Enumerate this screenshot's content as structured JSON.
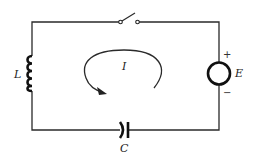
{
  "diagram": {
    "type": "circuit",
    "components": {
      "inductor": {
        "label": "L"
      },
      "capacitor": {
        "label": "C"
      },
      "source": {
        "label": "E",
        "positive": "+",
        "negative": "−"
      },
      "switch": {
        "state": "open"
      },
      "current": {
        "label": "I",
        "direction": "counterclockwise-arrow"
      }
    }
  }
}
